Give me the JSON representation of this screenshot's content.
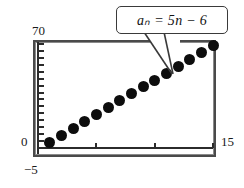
{
  "figure": {
    "kind": "graphing-calculator-screen",
    "callout_label": "aₙ = 5n − 6"
  },
  "axis_labels": {
    "y_max": "70",
    "origin": "0",
    "y_min": "−5",
    "x_max": "15"
  },
  "colors": {
    "frame": "#4a4a4a",
    "axis": "#2b2b2b",
    "point": "#0d0d0d",
    "callout_border": "#3a3a3a",
    "background": "#ffffff"
  },
  "chart_data": {
    "type": "scatter",
    "title": "",
    "subtitle": "",
    "xlabel": "",
    "ylabel": "",
    "annotations": [
      "aₙ = 5n − 6"
    ],
    "legend": [],
    "legend_position": "none",
    "grid": false,
    "xlim": [
      0,
      15
    ],
    "ylim": [
      -5,
      70
    ],
    "x_ticks": [
      0,
      5,
      10,
      15
    ],
    "y_ticks": [
      -5,
      0,
      5,
      10,
      15,
      20,
      25,
      30,
      35,
      40,
      45,
      50,
      55,
      60,
      65,
      70
    ],
    "formula": "a_n = 5n - 6",
    "series": [
      {
        "name": "aₙ = 5n − 6",
        "x": [
          1,
          2,
          3,
          4,
          5,
          6,
          7,
          8,
          9,
          10,
          11,
          12,
          13,
          14,
          15
        ],
        "y": [
          -1,
          4,
          9,
          14,
          19,
          24,
          29,
          34,
          39,
          44,
          49,
          54,
          59,
          64,
          69
        ]
      }
    ]
  }
}
